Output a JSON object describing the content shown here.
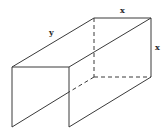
{
  "figure": {
    "stroke_color": "#3a3a3a",
    "labels": {
      "length": "y",
      "top_width": "x",
      "right_height": "x"
    }
  }
}
